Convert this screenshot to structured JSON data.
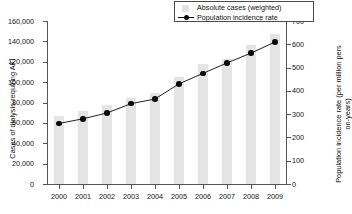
{
  "legend": {
    "position": "top-right",
    "items": [
      {
        "label": "Absolute cases (weighted)",
        "type": "bar",
        "color": "#e4e4e4"
      },
      {
        "label": "Population incidence rate",
        "type": "line-marker",
        "color": "#0a0a0a"
      }
    ]
  },
  "axes": {
    "left_title": "Cases of dialysis-requiring AKI",
    "right_title": "Population incidence rate (per million pers on-years)",
    "left_ticks": [
      "0",
      "20,000",
      "40,000",
      "60,000",
      "80,000",
      "100,000",
      "120,000",
      "140,000",
      "160,000"
    ],
    "right_ticks": [
      "0",
      "100",
      "200",
      "300",
      "400",
      "500",
      "600",
      "700"
    ],
    "x_ticks": [
      "2000",
      "2001",
      "2002",
      "2003",
      "2004",
      "2005",
      "2006",
      "2007",
      "2008",
      "2009"
    ]
  },
  "chart_data": {
    "type": "bar",
    "title": "",
    "xlabel": "",
    "ylabel": "Cases of dialysis-requiring AKI",
    "y2label": "Population incidence rate (per million pers on-years)",
    "categories": [
      "2000",
      "2001",
      "2002",
      "2003",
      "2004",
      "2005",
      "2006",
      "2007",
      "2008",
      "2009"
    ],
    "grid": false,
    "legend_position": "top-right",
    "ylim": [
      0,
      160000
    ],
    "y2lim": [
      0,
      700
    ],
    "series": [
      {
        "name": "Absolute cases (weighted)",
        "type": "bar",
        "axis": "left",
        "color": "#e4e4e4",
        "values": [
          67000,
          72000,
          78000,
          84000,
          89000,
          105000,
          118000,
          123000,
          136000,
          147000
        ]
      },
      {
        "name": "Population incidence rate",
        "type": "line",
        "axis": "right",
        "color": "#0a0a0a",
        "values": [
          260,
          280,
          305,
          345,
          365,
          430,
          475,
          520,
          562,
          610
        ]
      }
    ]
  }
}
